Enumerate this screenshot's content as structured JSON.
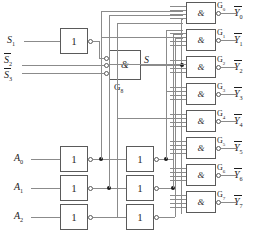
{
  "diagram": {
    "colors": {
      "wire": "#8b8b8b",
      "box_border": "#5a5a5a",
      "text": "#1c1c1c",
      "background": "#ffffff",
      "junction": "#1c1c1c"
    }
  },
  "inputs": {
    "enable": [
      {
        "id": "S1",
        "label": "S",
        "sub": "1",
        "overline": false
      },
      {
        "id": "S2n",
        "label": "S",
        "sub": "2",
        "overline": true
      },
      {
        "id": "S3n",
        "label": "S",
        "sub": "3",
        "overline": true
      }
    ],
    "address": [
      {
        "id": "A0",
        "label": "A",
        "sub": "0"
      },
      {
        "id": "A1",
        "label": "A",
        "sub": "1"
      },
      {
        "id": "A2",
        "label": "A",
        "sub": "2"
      }
    ]
  },
  "gates": {
    "enable_inverter": {
      "id": "INV_S1",
      "symbol": "1"
    },
    "enable_and": {
      "id": "G8",
      "symbol": "&",
      "label": "G",
      "sub": "8",
      "output_label": "S",
      "inputs": 3
    },
    "address_inverters_col1": [
      {
        "id": "INV_A0_1",
        "symbol": "1"
      },
      {
        "id": "INV_A1_1",
        "symbol": "1"
      },
      {
        "id": "INV_A2_1",
        "symbol": "1"
      }
    ],
    "address_inverters_col2": [
      {
        "id": "INV_A0_2",
        "symbol": "1"
      },
      {
        "id": "INV_A1_2",
        "symbol": "1"
      },
      {
        "id": "INV_A2_2",
        "symbol": "1"
      }
    ],
    "nand_gates": [
      {
        "id": "G0",
        "symbol": "&",
        "label": "G",
        "sub": "0",
        "out_label": "Y",
        "out_sub": "0",
        "inputs": 4
      },
      {
        "id": "G1",
        "symbol": "&",
        "label": "G",
        "sub": "1",
        "out_label": "Y",
        "out_sub": "1",
        "inputs": 4
      },
      {
        "id": "G2",
        "symbol": "&",
        "label": "G",
        "sub": "2",
        "out_label": "Y",
        "out_sub": "2",
        "inputs": 4
      },
      {
        "id": "G3",
        "symbol": "&",
        "label": "G",
        "sub": "3",
        "out_label": "Y",
        "out_sub": "3",
        "inputs": 4
      },
      {
        "id": "G4",
        "symbol": "&",
        "label": "G",
        "sub": "4",
        "out_label": "Y",
        "out_sub": "4",
        "inputs": 4
      },
      {
        "id": "G5",
        "symbol": "&",
        "label": "G",
        "sub": "5",
        "out_label": "Y",
        "out_sub": "5",
        "inputs": 4
      },
      {
        "id": "G6",
        "symbol": "&",
        "label": "G",
        "sub": "6",
        "out_label": "Y",
        "out_sub": "6",
        "inputs": 4
      },
      {
        "id": "G7",
        "symbol": "&",
        "label": "G",
        "sub": "7",
        "out_label": "Y",
        "out_sub": "7",
        "inputs": 4
      }
    ]
  }
}
